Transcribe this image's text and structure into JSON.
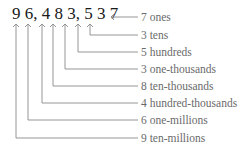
{
  "number": {
    "display": "9 6, 4 8 3, 5 3 7",
    "digits": [
      "9",
      "6",
      "4",
      "8",
      "3",
      "5",
      "3",
      "7"
    ]
  },
  "labels": [
    {
      "digit": "7",
      "place": "ones",
      "text": "7 ones"
    },
    {
      "digit": "3",
      "place": "tens",
      "text": "3 tens"
    },
    {
      "digit": "5",
      "place": "hundreds",
      "text": "5 hundreds"
    },
    {
      "digit": "3",
      "place": "one-thousands",
      "text": "3 one-thousands"
    },
    {
      "digit": "8",
      "place": "ten-thousands",
      "text": "8 ten-thousands"
    },
    {
      "digit": "4",
      "place": "hundred-thousands",
      "text": "4 hundred-thousands"
    },
    {
      "digit": "6",
      "place": "one-millions",
      "text": "6 one-millions"
    },
    {
      "digit": "9",
      "place": "ten-millions",
      "text": "9 ten-millions"
    }
  ],
  "colors": {
    "number": "#1a1a1a",
    "lines": "#8a8a8a",
    "labels": "#6a6a6a"
  }
}
